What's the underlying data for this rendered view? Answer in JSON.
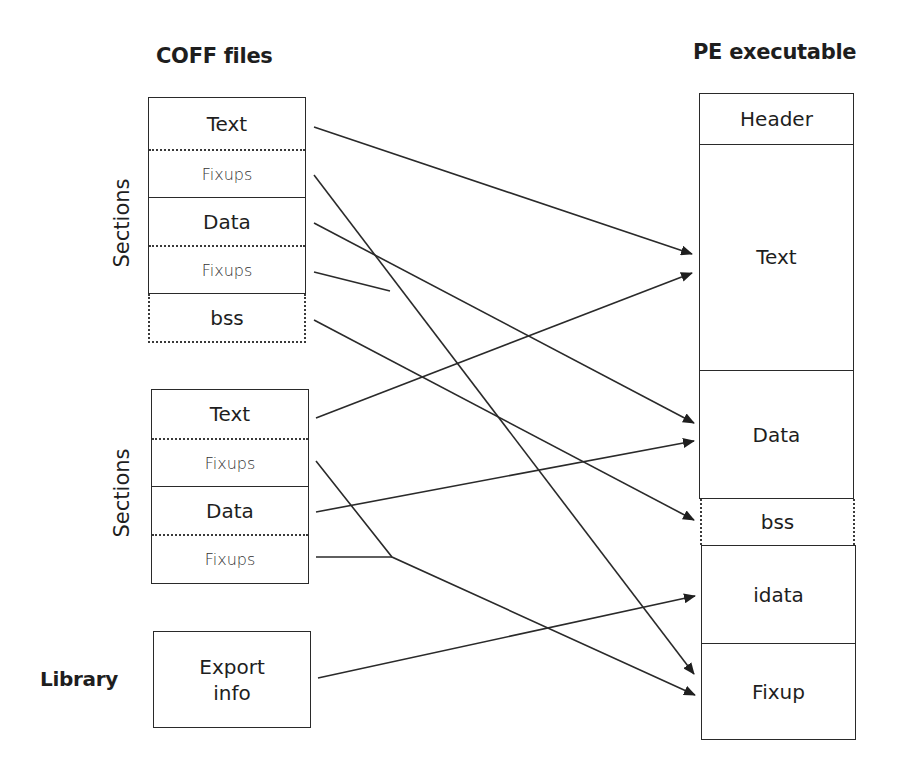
{
  "left": {
    "title": "COFF files",
    "groups": [
      {
        "label": "Sections",
        "cells": [
          {
            "text": "Text",
            "kind": "major"
          },
          {
            "text": "Fixups",
            "kind": "minor"
          },
          {
            "text": "Data",
            "kind": "major"
          },
          {
            "text": "Fixups",
            "kind": "minor"
          },
          {
            "text": "bss",
            "kind": "major",
            "dotted": true
          }
        ]
      },
      {
        "label": "Sections",
        "cells": [
          {
            "text": "Text",
            "kind": "major"
          },
          {
            "text": "Fixups",
            "kind": "minor"
          },
          {
            "text": "Data",
            "kind": "major"
          },
          {
            "text": "Fixups",
            "kind": "minor"
          }
        ]
      }
    ],
    "library": {
      "label": "Library",
      "cell_line1": "Export",
      "cell_line2": "info"
    }
  },
  "right": {
    "title": "PE executable",
    "cells": [
      {
        "text": "Header"
      },
      {
        "text": "Text"
      },
      {
        "text": "Data"
      },
      {
        "text": "bss",
        "dotted": true
      },
      {
        "text": "idata"
      },
      {
        "text": "Fixup"
      }
    ]
  },
  "connections": [
    {
      "from": "COFF1.Text",
      "to": "PE.Text"
    },
    {
      "from": "COFF1.Fixups(Text)",
      "to": "PE.Fixup"
    },
    {
      "from": "COFF1.Data",
      "to": "PE.Data"
    },
    {
      "from": "COFF1.Fixups(Data)",
      "to": "PE.Fixup",
      "merged": true
    },
    {
      "from": "COFF1.bss",
      "to": "PE.bss"
    },
    {
      "from": "COFF2.Text",
      "to": "PE.Text"
    },
    {
      "from": "COFF2.Fixups(Text)",
      "to": "PE.Fixup"
    },
    {
      "from": "COFF2.Data",
      "to": "PE.Data"
    },
    {
      "from": "COFF2.Fixups(Data)",
      "to": "PE.Fixup",
      "merged": true
    },
    {
      "from": "Library.Export info",
      "to": "PE.idata"
    }
  ],
  "colors": {
    "line": "#2a2a2a",
    "background": "#ffffff"
  }
}
